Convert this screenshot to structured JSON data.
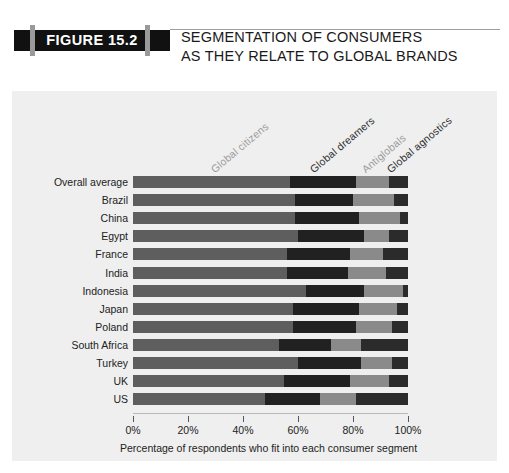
{
  "header": {
    "figure_tag": "FIGURE 15.2",
    "title_line1": "SEGMENTATION OF CONSUMERS",
    "title_line2": "AS THEY RELATE TO GLOBAL BRANDS"
  },
  "chart_data": {
    "type": "bar",
    "orientation": "horizontal",
    "stacked": true,
    "title": "SEGMENTATION OF CONSUMERS AS THEY RELATE TO GLOBAL BRANDS",
    "xlabel": "Percentage of respondents who fit into each consumer segment",
    "ylabel": "",
    "xlim": [
      0,
      100
    ],
    "xticks": [
      0,
      20,
      40,
      60,
      80,
      100
    ],
    "xtick_labels": [
      "0%",
      "20%",
      "40%",
      "60%",
      "80%",
      "100%"
    ],
    "grid": false,
    "legend_position": "top-diagonal",
    "series": [
      {
        "name": "Global citizens",
        "color": "#5e5e5e",
        "values": [
          57,
          59,
          59,
          60,
          56,
          56,
          63,
          58,
          58,
          53,
          60,
          55,
          48
        ]
      },
      {
        "name": "Global dreamers",
        "color": "#212121",
        "values": [
          24,
          21,
          23,
          24,
          23,
          22,
          21,
          24,
          23,
          19,
          23,
          24,
          20
        ]
      },
      {
        "name": "Antiglobals",
        "color": "#8a8a8a",
        "values": [
          12,
          15,
          15,
          9,
          12,
          14,
          14,
          14,
          13,
          11,
          11,
          14,
          13
        ]
      },
      {
        "name": "Global agnostics",
        "color": "#2b2b2b",
        "values": [
          7,
          5,
          3,
          7,
          9,
          8,
          2,
          4,
          6,
          17,
          6,
          7,
          19
        ]
      }
    ],
    "categories": [
      "Overall average",
      "Brazil",
      "China",
      "Egypt",
      "France",
      "India",
      "Indonesia",
      "Japan",
      "Poland",
      "South Africa",
      "Turkey",
      "UK",
      "US"
    ]
  }
}
